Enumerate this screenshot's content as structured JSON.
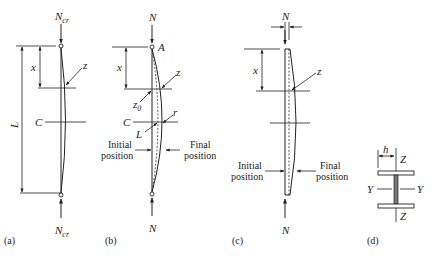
{
  "figure": {
    "panels": {
      "a": {
        "caption": "(a)",
        "top_force": {
          "symbol": "N",
          "subscript": "cr"
        },
        "bottom_force": {
          "symbol": "N",
          "subscript": "cr"
        },
        "dim_x": "x",
        "dim_L": "L",
        "label_z": "z",
        "label_C": "C"
      },
      "b": {
        "caption": "(b)",
        "top_force": "N",
        "bottom_force": "N",
        "label_A": "A",
        "dim_x": "x",
        "label_z": "z",
        "label_z0": {
          "symbol": "z",
          "subscript": "0"
        },
        "label_C": "C",
        "label_L": "L",
        "label_r": "r",
        "initial_position": [
          "Initial",
          "position"
        ],
        "final_position": [
          "Final",
          "position"
        ]
      },
      "c": {
        "caption": "(c)",
        "top_force": "N",
        "bottom_force": "N",
        "dim_x": "x",
        "label_z": "z",
        "initial_position": [
          "Initial",
          "position"
        ],
        "final_position": [
          "Final",
          "position"
        ]
      },
      "d": {
        "caption": "(d)",
        "dim_h": "h",
        "axis_Z_top": "Z",
        "axis_Z_bottom": "Z",
        "axis_Y_left": "Y",
        "axis_Y_right": "Y"
      }
    }
  }
}
